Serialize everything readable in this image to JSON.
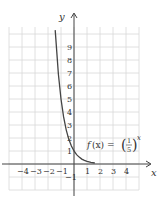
{
  "chart_data": {
    "type": "line",
    "title": "",
    "xlabel": "x",
    "ylabel": "y",
    "xlim": [
      -5,
      5
    ],
    "ylim": [
      -2,
      10
    ],
    "grid": true,
    "x_ticks": [
      "−4",
      "−3",
      "−2",
      "−1",
      "1",
      "2",
      "3",
      "4"
    ],
    "x_tick_values": [
      -4,
      -3,
      -2,
      -1,
      1,
      2,
      3,
      4
    ],
    "y_ticks": [
      "−1",
      "1",
      "2",
      "3",
      "4",
      "5",
      "6",
      "7",
      "8",
      "9"
    ],
    "y_tick_values": [
      -1,
      1,
      2,
      3,
      4,
      5,
      6,
      7,
      8,
      9
    ],
    "series": [
      {
        "name": "f(x) = (1/5)^x",
        "function": "(1/5)^x",
        "x": [
          -1.45,
          -1.2,
          -1,
          -0.8,
          -0.6,
          -0.4,
          -0.2,
          0,
          0.2,
          0.4,
          0.6,
          0.8,
          1,
          1.3,
          1.6
        ],
        "values": [
          10.3,
          6.9,
          5,
          3.62,
          2.63,
          1.9,
          1.38,
          1,
          0.72,
          0.53,
          0.38,
          0.28,
          0.2,
          0.12,
          0.08
        ]
      }
    ],
    "annotations": [
      {
        "text": "f(x) = (1/5)^x",
        "x": 2.5,
        "y": 1.7
      }
    ]
  },
  "labels": {
    "x_axis": "x",
    "y_axis": "y",
    "fn_f": "f",
    "fn_x_paren": "(x) = ",
    "fn_num": "1",
    "fn_den": "5",
    "fn_exp": "x"
  }
}
